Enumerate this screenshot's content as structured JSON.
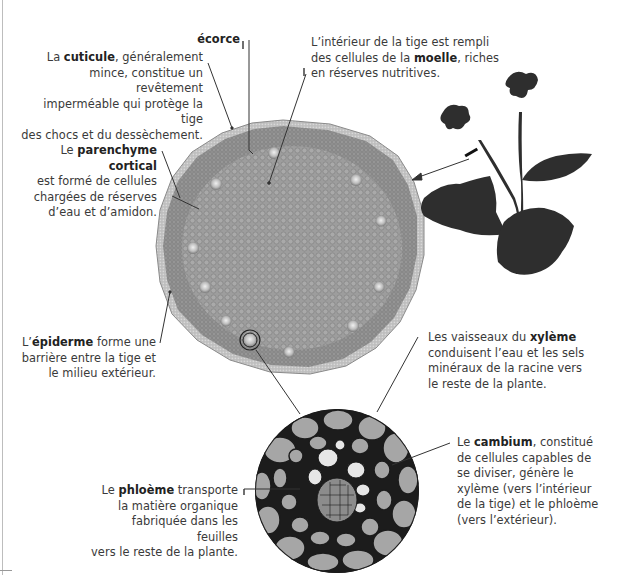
{
  "diagram": {
    "labels": {
      "ecorce": {
        "term": "écorce"
      },
      "cuticule": {
        "prefix": "La ",
        "term": "cuticule",
        "suffix": ", généralement",
        "lines": [
          "mince, constitue un revêtement",
          "imperméable qui protège la tige",
          "des chocs et du dessèchement."
        ]
      },
      "moelle": {
        "line1": "L’intérieur de la tige est rempli",
        "line2_prefix": "des cellules de la ",
        "term": "moelle",
        "line2_suffix": ", riches",
        "line3": "en réserves nutritives."
      },
      "parenchyme": {
        "prefix": "Le ",
        "term": "parenchyme cortical",
        "lines": [
          "est formé de cellules",
          "chargées de réserves",
          "d’eau et d’amidon."
        ]
      },
      "epiderme": {
        "prefix": "L’",
        "term": "épiderme",
        "suffix": " forme une",
        "lines": [
          "barrière entre la tige et",
          "le milieu extérieur."
        ]
      },
      "xyleme": {
        "prefix": "Les vaisseaux du ",
        "term": "xylème",
        "lines": [
          "conduisent l’eau et les sels",
          "minéraux de la racine vers",
          "le reste de la plante."
        ]
      },
      "cambium": {
        "prefix": "Le ",
        "term": "cambium",
        "suffix": ", constitué",
        "lines": [
          "de cellules capables de",
          "se diviser, génère le",
          "xylème (vers l’intérieur",
          "de la tige) et le phloème",
          "(vers l’extérieur)."
        ]
      },
      "phloeme": {
        "prefix": "Le ",
        "term": "phloème",
        "suffix": " transporte",
        "lines": [
          "la matière organique",
          "fabriquée dans les feuilles",
          "vers le reste de la plante."
        ]
      }
    },
    "colors": {
      "text": "#3a3a3a",
      "stem_fill": "#9a9a9a",
      "cuticle": "#b8b8b8",
      "cells": "#a8a8a8",
      "cell_walls": "#222222",
      "plant": "#2e2e2e",
      "leader_lines": "#333333"
    }
  }
}
